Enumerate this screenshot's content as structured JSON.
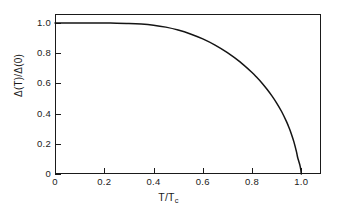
{
  "chart_data": {
    "type": "line",
    "title": "",
    "subtitle": "",
    "xlabel": "T/Tc",
    "xlabel_base": "T/T",
    "xlabel_sub": "c",
    "ylabel": "Δ(T)/Δ(0)",
    "xlim": [
      0,
      1.08
    ],
    "ylim": [
      0,
      1.06
    ],
    "xticks": [
      0,
      0.2,
      0.4,
      0.6,
      0.8,
      1.0
    ],
    "xticklabels": [
      "0",
      "0.2",
      "0.4",
      "0.6",
      "0.8",
      "1.0"
    ],
    "yticks": [
      0,
      0.2,
      0.4,
      0.6,
      0.8,
      1.0
    ],
    "yticklabels": [
      "0",
      "0.2",
      "0.4",
      "0.6",
      "0.8",
      "1.0"
    ],
    "grid": false,
    "legend": false,
    "legend_position": "none",
    "line_color": "#141414",
    "frame_color": "#1a1a1a",
    "background_color": "#ffffff",
    "series": [
      {
        "name": "BCS gap",
        "x": [
          0.0,
          0.05,
          0.1,
          0.15,
          0.2,
          0.25,
          0.3,
          0.35,
          0.4,
          0.45,
          0.5,
          0.55,
          0.6,
          0.65,
          0.7,
          0.75,
          0.8,
          0.82,
          0.84,
          0.86,
          0.88,
          0.9,
          0.92,
          0.94,
          0.95,
          0.96,
          0.97,
          0.98,
          0.985,
          0.99,
          0.995,
          0.998,
          1.0
        ],
        "values": [
          1.0,
          1.0,
          1.0,
          1.0,
          0.9999,
          0.9994,
          0.9978,
          0.9938,
          0.986,
          0.973,
          0.954,
          0.928,
          0.895,
          0.854,
          0.804,
          0.744,
          0.672,
          0.639,
          0.603,
          0.563,
          0.519,
          0.47,
          0.414,
          0.347,
          0.308,
          0.264,
          0.213,
          0.15,
          0.111,
          0.083,
          0.054,
          0.029,
          0.0
        ]
      }
    ]
  },
  "axes": {
    "y_ticks": [
      {
        "label": "1.0",
        "value": 1.0
      },
      {
        "label": "0.8",
        "value": 0.8
      },
      {
        "label": "0.6",
        "value": 0.6
      },
      {
        "label": "0.4",
        "value": 0.4
      },
      {
        "label": "0.2",
        "value": 0.2
      },
      {
        "label": "0",
        "value": 0.0
      }
    ],
    "x_ticks": [
      {
        "label": "0",
        "value": 0.0
      },
      {
        "label": "0.2",
        "value": 0.2
      },
      {
        "label": "0.4",
        "value": 0.4
      },
      {
        "label": "0.6",
        "value": 0.6
      },
      {
        "label": "0.8",
        "value": 0.8
      },
      {
        "label": "1.0",
        "value": 1.0
      }
    ],
    "y_title": "Δ(T)/Δ(0)",
    "x_title_base": "T/T",
    "x_title_sub": "c"
  }
}
